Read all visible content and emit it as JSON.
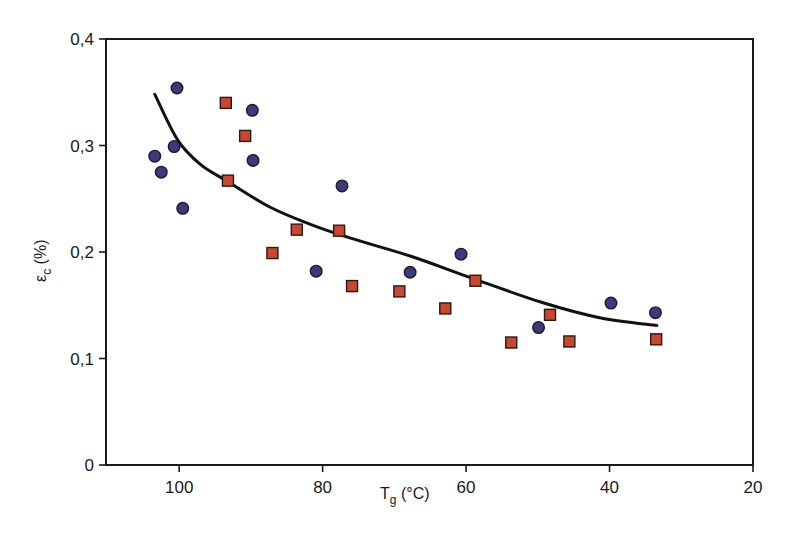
{
  "chart_data": {
    "type": "scatter",
    "title": "",
    "xlabel": "T",
    "xlabel_sub": "g",
    "xlabel_unit": " (°C)",
    "ylabel": "ε",
    "ylabel_sub": "c",
    "ylabel_unit": " (%)",
    "xlim": [
      110.2,
      20
    ],
    "ylim": [
      0,
      0.4
    ],
    "x_reversed": true,
    "grid": false,
    "legend": null,
    "x_ticks": [
      100,
      80,
      60,
      40,
      20
    ],
    "x_tick_labels": [
      "100",
      "80",
      "60",
      "40",
      "20"
    ],
    "y_ticks": [
      0,
      0.1,
      0.2,
      0.3,
      0.4
    ],
    "y_tick_labels": [
      "0",
      "0,1",
      "0,2",
      "0,3",
      "0,4"
    ],
    "series": [
      {
        "name": "circles",
        "marker": "circle",
        "color": "#3b3a7a",
        "points": [
          [
            103.4,
            0.29
          ],
          [
            102.5,
            0.275
          ],
          [
            100.7,
            0.299
          ],
          [
            100.3,
            0.354
          ],
          [
            99.5,
            0.241
          ],
          [
            89.8,
            0.333
          ],
          [
            89.7,
            0.286
          ],
          [
            80.9,
            0.182
          ],
          [
            77.3,
            0.262
          ],
          [
            67.8,
            0.181
          ],
          [
            60.7,
            0.198
          ],
          [
            49.9,
            0.129
          ],
          [
            39.8,
            0.152
          ],
          [
            33.6,
            0.143
          ]
        ]
      },
      {
        "name": "squares",
        "marker": "square",
        "color": "#c8472e",
        "points": [
          [
            93.5,
            0.34
          ],
          [
            90.8,
            0.309
          ],
          [
            93.2,
            0.267
          ],
          [
            87.0,
            0.199
          ],
          [
            83.6,
            0.221
          ],
          [
            77.7,
            0.22
          ],
          [
            75.9,
            0.168
          ],
          [
            69.3,
            0.163
          ],
          [
            62.9,
            0.147
          ],
          [
            58.7,
            0.173
          ],
          [
            53.7,
            0.115
          ],
          [
            48.3,
            0.141
          ],
          [
            45.6,
            0.116
          ],
          [
            33.5,
            0.118
          ]
        ]
      },
      {
        "name": "fit",
        "marker": "line",
        "color": "#111111",
        "points": [
          [
            103.4,
            0.348
          ],
          [
            100.2,
            0.305
          ],
          [
            97.0,
            0.282
          ],
          [
            93.2,
            0.266
          ],
          [
            87.3,
            0.242
          ],
          [
            81.7,
            0.226
          ],
          [
            76.1,
            0.213
          ],
          [
            67.7,
            0.196
          ],
          [
            59.4,
            0.176
          ],
          [
            49.6,
            0.153
          ],
          [
            41.2,
            0.138
          ],
          [
            33.4,
            0.131
          ]
        ]
      }
    ]
  },
  "plot": {
    "frame": {
      "left": 106,
      "top": 39,
      "right": 753,
      "bottom": 465
    }
  }
}
